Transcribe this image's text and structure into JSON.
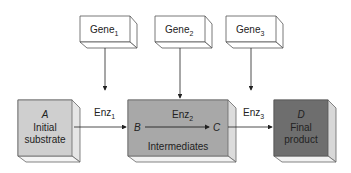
{
  "genes": [
    {
      "label": "Gene",
      "sub": "1"
    },
    {
      "label": "Gene",
      "sub": "2"
    },
    {
      "label": "Gene",
      "sub": "3"
    }
  ],
  "enzymes": [
    {
      "label": "Enz",
      "sub": "1"
    },
    {
      "label": "Enz",
      "sub": "2"
    },
    {
      "label": "Enz",
      "sub": "3"
    }
  ],
  "boxes": {
    "initial": {
      "letter": "A",
      "line1": "Initial",
      "line2": "substrate",
      "color": "#cfcfcf"
    },
    "intermediates": {
      "letter_b": "B",
      "letter_c": "C",
      "label": "Intermediates",
      "color": "#a8a8a8"
    },
    "final": {
      "letter": "D",
      "line1": "Final",
      "line2": "product",
      "color": "#6e6e6e"
    }
  }
}
